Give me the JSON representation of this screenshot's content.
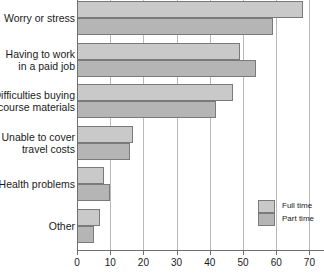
{
  "chart_data": {
    "type": "bar",
    "orientation": "horizontal",
    "title": "",
    "xlabel": "",
    "ylabel": "",
    "xlim": [
      0,
      70
    ],
    "xticks": [
      0,
      10,
      20,
      30,
      40,
      50,
      60,
      70
    ],
    "xtick_labels": [
      "0",
      "10",
      "20",
      "30",
      "40",
      "50",
      "60",
      "70"
    ],
    "grid": "vertical",
    "legend_position": "lower-right-inside",
    "categories": [
      "Worry or stress",
      "Having to work\nin a paid job",
      "Difficulties buying\ncourse materials",
      "Unable to cover\ntravel costs",
      "Health problems",
      "Other"
    ],
    "series": [
      {
        "name": "Full time",
        "color": "#c9c9c9",
        "values": [
          68,
          49,
          47,
          17,
          8,
          7
        ]
      },
      {
        "name": "Part time",
        "color": "#b5b5b5",
        "values": [
          59,
          54,
          42,
          16,
          10,
          5
        ]
      }
    ]
  },
  "legend": {
    "items": [
      {
        "label": "Full time"
      },
      {
        "label": "Part time"
      }
    ]
  },
  "colors": {
    "full_time": "#c9c9c9",
    "part_time": "#b5b5b5",
    "bar_border": "#7a7a7a",
    "axis": "#6f6f6f",
    "gridline": "#b9b9b9",
    "background": "#ffffff",
    "text": "#1a1a1a"
  }
}
